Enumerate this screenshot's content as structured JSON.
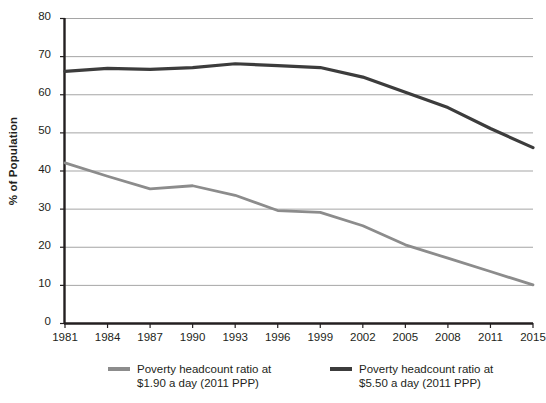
{
  "chart_data": {
    "type": "line",
    "title": "",
    "xlabel": "",
    "ylabel": "% of Population",
    "ylim": [
      0,
      80
    ],
    "ytick_values": [
      0,
      10,
      20,
      30,
      40,
      50,
      60,
      70,
      80
    ],
    "ytick_labels": [
      "0",
      "10",
      "20",
      "30",
      "40",
      "50",
      "60",
      "70",
      "80"
    ],
    "grid": true,
    "legend_position": "bottom",
    "categories": [
      "1981",
      "1984",
      "1987",
      "1990",
      "1993",
      "1996",
      "1999",
      "2002",
      "2005",
      "2008",
      "2011",
      "2015"
    ],
    "x": [
      1981,
      1984,
      1987,
      1990,
      1993,
      1996,
      1999,
      2002,
      2005,
      2008,
      2011,
      2015
    ],
    "series": [
      {
        "name": "Poverty headcount ratio at\n$1.90 a day (2011 PPP)",
        "color": "#8c8c8c",
        "values": [
          42.0,
          38.5,
          35.2,
          36.0,
          33.5,
          29.5,
          29.0,
          25.5,
          20.5,
          17.0,
          13.5,
          10.0
        ]
      },
      {
        "name": "Poverty headcount ratio at\n$5.50 a day (2011 PPP)",
        "color": "#3c3c3c",
        "values": [
          66.0,
          66.8,
          66.5,
          67.0,
          68.0,
          67.5,
          67.0,
          64.5,
          60.5,
          56.5,
          51.0,
          46.0
        ]
      }
    ]
  },
  "axis": {
    "y_title": "% of Population"
  },
  "legend": {
    "items": [
      {
        "label": "Poverty headcount ratio at\n$1.90 a day (2011 PPP)",
        "color": "#8c8c8c"
      },
      {
        "label": "Poverty headcount ratio at\n$5.50 a day (2011 PPP)",
        "color": "#3c3c3c"
      }
    ]
  }
}
